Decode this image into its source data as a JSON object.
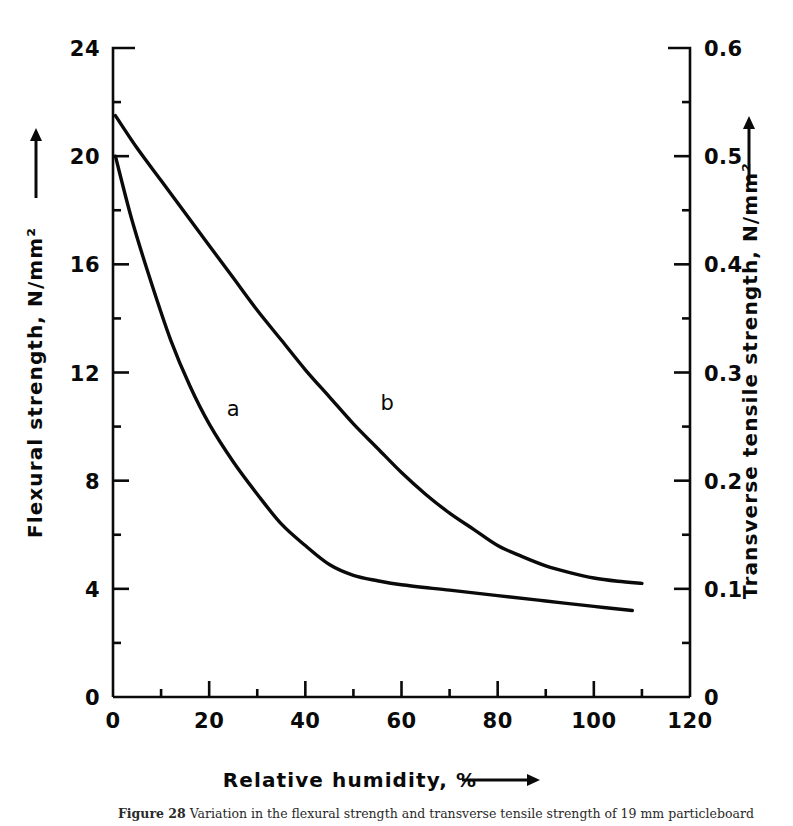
{
  "figure": {
    "caption_label": "Figure 28",
    "caption_text": "Variation in the flexural strength and transverse tensile strength of 19 mm particleboard"
  },
  "chart_data": {
    "type": "line",
    "title": "",
    "xlabel": "Relative humidity, %",
    "ylabel": "Flexural strength, N/mm²",
    "y2label": "Transverse tensile strength, N/mm²",
    "xlim": [
      0,
      120
    ],
    "ylim": [
      0,
      24
    ],
    "y2lim": [
      0,
      0.6
    ],
    "grid": false,
    "legend": "inline-curve-labels",
    "xticks": [
      0,
      20,
      40,
      60,
      80,
      100,
      120
    ],
    "xticklabels": [
      "0",
      "20",
      "40",
      "60",
      "80",
      "100",
      "120"
    ],
    "xminorticks": [
      10,
      30,
      50,
      70,
      90,
      110
    ],
    "yticks": [
      0,
      4,
      8,
      12,
      16,
      20,
      24
    ],
    "yticklabels": [
      "0",
      "4",
      "8",
      "12",
      "16",
      "20",
      "24"
    ],
    "yminorticks": [
      2,
      6,
      10,
      14,
      18,
      22
    ],
    "y2ticks": [
      0,
      0.1,
      0.2,
      0.3,
      0.4,
      0.5,
      0.6
    ],
    "y2ticklabels": [
      "0",
      "0.1",
      "0.2",
      "0.3",
      "0.4",
      "0.5",
      "0.6"
    ],
    "y2minorticks": [
      0.05,
      0.15,
      0.25,
      0.35,
      0.45,
      0.55
    ],
    "series": [
      {
        "name": "a",
        "label": "a",
        "axis": "left",
        "label_x": 25,
        "label_y": 10.4,
        "points": [
          [
            0.5,
            20.0
          ],
          [
            4,
            17.6
          ],
          [
            8,
            15.3
          ],
          [
            12,
            13.2
          ],
          [
            16,
            11.5
          ],
          [
            20,
            10.1
          ],
          [
            25,
            8.7
          ],
          [
            30,
            7.5
          ],
          [
            35,
            6.4
          ],
          [
            40,
            5.6
          ],
          [
            45,
            4.9
          ],
          [
            50,
            4.5
          ],
          [
            55,
            4.3
          ],
          [
            60,
            4.15
          ],
          [
            70,
            3.95
          ],
          [
            80,
            3.75
          ],
          [
            90,
            3.55
          ],
          [
            100,
            3.35
          ],
          [
            108,
            3.2
          ]
        ]
      },
      {
        "name": "b",
        "label": "b",
        "axis": "left",
        "label_x": 57,
        "label_y": 10.6,
        "points": [
          [
            0.5,
            21.5
          ],
          [
            5,
            20.3
          ],
          [
            10,
            19.1
          ],
          [
            15,
            17.9
          ],
          [
            20,
            16.7
          ],
          [
            25,
            15.5
          ],
          [
            30,
            14.3
          ],
          [
            35,
            13.2
          ],
          [
            40,
            12.1
          ],
          [
            45,
            11.1
          ],
          [
            50,
            10.1
          ],
          [
            55,
            9.2
          ],
          [
            60,
            8.3
          ],
          [
            65,
            7.5
          ],
          [
            70,
            6.8
          ],
          [
            75,
            6.2
          ],
          [
            80,
            5.6
          ],
          [
            85,
            5.2
          ],
          [
            90,
            4.85
          ],
          [
            95,
            4.6
          ],
          [
            100,
            4.4
          ],
          [
            105,
            4.28
          ],
          [
            110,
            4.2
          ]
        ]
      }
    ],
    "arrows": {
      "x_axis_arrow": "right",
      "y_axis_arrow": "up",
      "y2_axis_arrow": "up"
    }
  }
}
